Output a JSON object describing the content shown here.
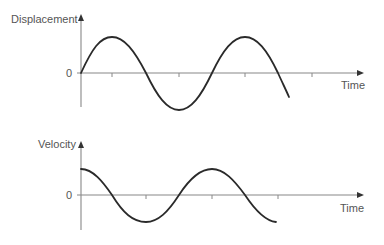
{
  "diagram": {
    "panels": [
      {
        "id": "displacement",
        "ylabel": "Displacement",
        "xlabel": "Time",
        "zero_label": "0",
        "curve": "sine",
        "colors": {
          "axis": "#888888",
          "curve": "#2a2a2a",
          "text": "#555555"
        }
      },
      {
        "id": "velocity",
        "ylabel": "Velocity",
        "xlabel": "Time",
        "zero_label": "0",
        "curve": "cosine",
        "colors": {
          "axis": "#888888",
          "curve": "#2a2a2a",
          "text": "#555555"
        }
      }
    ]
  }
}
